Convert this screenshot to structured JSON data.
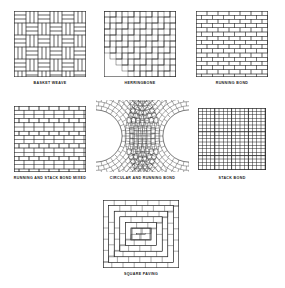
{
  "sheet": {
    "background_color": "#ffffff",
    "line_color": "#2b2b2b",
    "text_color": "#1a1a1a",
    "width": 285,
    "height": 288,
    "title": ""
  },
  "patterns": [
    {
      "id": "basket-weave",
      "label": "BASKET WEAVE",
      "type": "basket",
      "x": 14,
      "y": 11,
      "w": 72,
      "h": 66,
      "caption_x": 14,
      "caption_y": 81,
      "caption_w": 72,
      "unit": 12,
      "bricks_per_unit": 3
    },
    {
      "id": "herringbone",
      "label": "HERRINGBONE",
      "type": "herringbone",
      "x": 104,
      "y": 11,
      "w": 72,
      "h": 66,
      "caption_x": 104,
      "caption_y": 81,
      "caption_w": 72,
      "brick_length": 12,
      "brick_width": 6
    },
    {
      "id": "running-bond",
      "label": "RUNNING BOND",
      "type": "running",
      "x": 196,
      "y": 11,
      "w": 72,
      "h": 66,
      "caption_x": 196,
      "caption_y": 81,
      "caption_w": 72,
      "brick_length": 11,
      "course_height": 4.2,
      "offset": 0.5
    },
    {
      "id": "running-and-stack-bond-mixed",
      "label": "RUNNING AND STACK BOND MIXED",
      "type": "mixed",
      "x": 14,
      "y": 106,
      "w": 72,
      "h": 66,
      "caption_x": 2,
      "caption_y": 176,
      "caption_w": 96,
      "brick_length": 10,
      "course_height": 4.2,
      "stack_every": 3
    },
    {
      "id": "circular-and-running-bond",
      "label": "CIRCULAR AND RUNNING BOND",
      "type": "circular",
      "x": 96,
      "y": 100,
      "w": 93,
      "h": 72,
      "caption_x": 96,
      "caption_y": 176,
      "caption_w": 93,
      "circle_radius": 26,
      "circle_centers": [
        [
          96,
          136
        ],
        [
          189,
          136
        ]
      ],
      "ring_step": 4.2
    },
    {
      "id": "stack-bond",
      "label": "STACK BOND",
      "type": "stack",
      "x": 198,
      "y": 108,
      "w": 68,
      "h": 62,
      "caption_x": 198,
      "caption_y": 176,
      "caption_w": 68,
      "cell_w": 4.2,
      "cell_h": 3.4,
      "heavy_every": 4
    },
    {
      "id": "square-paving",
      "label": "SQUARE PAVING",
      "type": "square-paving",
      "x": 103,
      "y": 200,
      "w": 76,
      "h": 68,
      "caption_x": 103,
      "caption_y": 272,
      "caption_w": 76,
      "rings": 6,
      "ring_width": 5.6
    }
  ]
}
